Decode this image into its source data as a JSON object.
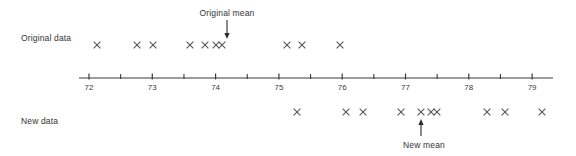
{
  "figure": {
    "background_color": "#ffffff",
    "mark_color": "#555555",
    "axis_color": "#3a3a3a",
    "text_color": "#333333"
  },
  "labels": {
    "original_row": "Original data",
    "new_row": "New data",
    "original_mean_annotation": "Original mean",
    "new_mean_annotation": "New mean"
  },
  "chart_data": {
    "type": "scatter",
    "title": "",
    "xlabel": "",
    "ylabel": "",
    "xlim": [
      71.85,
      79.35
    ],
    "grid": false,
    "legend": null,
    "axis": {
      "tick_labels": [
        "72",
        "73",
        "74",
        "75",
        "76",
        "77",
        "78",
        "79"
      ],
      "tick_values": [
        72,
        73,
        74,
        75,
        76,
        77,
        78,
        79
      ],
      "minor_tick_values": [
        72.5,
        73.5,
        74.5,
        75.5,
        76.5,
        77.5,
        78.5
      ],
      "pixel_start": 79,
      "pixel_end": 553,
      "pixel_at_72": 89,
      "pixels_per_unit": 63.3,
      "line_y": 78
    },
    "series": [
      {
        "name": "Original data",
        "row_y": 45,
        "values": [
          72.13,
          72.76,
          73.01,
          73.6,
          73.84,
          74.01,
          74.1,
          77.13,
          73.37,
          73.97
        ],
        "x_pixels": [
          97,
          137,
          153,
          190,
          205,
          216,
          222,
          287,
          302,
          340
        ],
        "mean": 74.18,
        "mean_pixel": 227
      },
      {
        "name": "New data",
        "row_y": 112,
        "values": [
          75.29,
          76.06,
          76.33,
          76.93,
          77.25,
          77.41,
          77.5,
          78.29,
          78.57,
          79.15
        ],
        "x_pixels": [
          297,
          346,
          363,
          401,
          421,
          431,
          437,
          487,
          505,
          542
        ],
        "mean": 77.25,
        "mean_pixel": 421
      }
    ],
    "annotations": [
      {
        "text": "Original mean",
        "x_pixel": 227,
        "direction": "down",
        "target_row": "Original data"
      },
      {
        "text": "New mean",
        "x_pixel": 421,
        "direction": "up",
        "target_row": "New data"
      }
    ]
  }
}
